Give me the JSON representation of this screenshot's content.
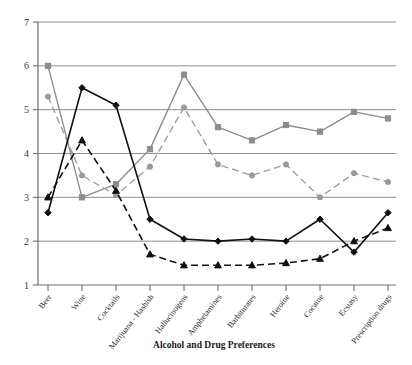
{
  "chart_data": {
    "type": "line",
    "title": "",
    "xlabel": "Alcohol and Drug Preferences",
    "ylabel": "",
    "ylim": [
      1,
      7
    ],
    "yticks": [
      1,
      2,
      3,
      4,
      5,
      6,
      7
    ],
    "grid": true,
    "legend": "none",
    "categories": [
      "Beer",
      "Wine",
      "Cocktails",
      "Marijuana - Hashish",
      "Hallucinogens",
      "Amphetamines",
      "Barbiturates",
      "Heroine",
      "Cocaine",
      "Ecstasy",
      "Prescription drugs"
    ],
    "series": [
      {
        "name": "series-gray-solid",
        "color": "#8c8c8c",
        "style": "solid",
        "marker": "square",
        "values": [
          6.0,
          3.0,
          3.3,
          4.1,
          5.8,
          4.6,
          4.3,
          4.65,
          4.5,
          4.95,
          4.8
        ]
      },
      {
        "name": "series-gray-dashed",
        "color": "#9a9a9a",
        "style": "dashed",
        "marker": "circle",
        "values": [
          5.3,
          3.5,
          3.05,
          3.7,
          5.05,
          3.75,
          3.5,
          3.75,
          3.0,
          3.55,
          3.35
        ]
      },
      {
        "name": "series-black-solid",
        "color": "#111111",
        "style": "solid",
        "marker": "diamond",
        "values": [
          2.65,
          5.5,
          5.1,
          2.5,
          2.05,
          2.0,
          2.05,
          2.0,
          2.5,
          1.75,
          2.65
        ]
      },
      {
        "name": "series-black-dashed",
        "color": "#111111",
        "style": "dashed",
        "marker": "triangle",
        "values": [
          3.0,
          4.3,
          3.15,
          1.7,
          1.45,
          1.45,
          1.45,
          1.5,
          1.6,
          2.0,
          2.3
        ]
      }
    ]
  },
  "axes": {
    "y_tick_labels": [
      "7",
      "6",
      "5",
      "4",
      "3",
      "2",
      "1"
    ],
    "x_axis_title": "Alcohol and Drug Preferences"
  },
  "colors": {
    "grid": "#8f8f8f",
    "axis": "#6f6f6f",
    "gray_series": "#8c8c8c",
    "black_series": "#111111",
    "background": "#ffffff"
  }
}
